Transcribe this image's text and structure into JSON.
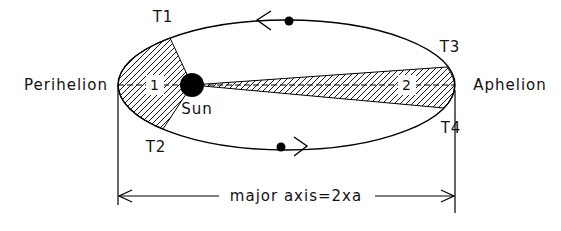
{
  "diagram": {
    "kind": "kepler-second-law-orbit",
    "labels": {
      "perihelion": "Perihelion",
      "aphelion": "Aphelion",
      "sun": "Sun",
      "t1": "T1",
      "t2": "T2",
      "t3": "T3",
      "t4": "T4",
      "area1": "1",
      "area2": "2",
      "major_axis": "major axis=2xa"
    },
    "colors": {
      "ink": "#000000",
      "background": "#ffffff",
      "hatch": "#000000"
    }
  }
}
